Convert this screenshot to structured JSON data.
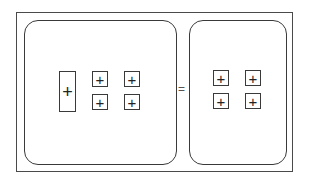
{
  "diagram": {
    "type": "algebra-tiles-equation",
    "left_side": {
      "tiles": [
        {
          "kind": "x",
          "sign": "+"
        },
        {
          "kind": "unit",
          "sign": "+"
        },
        {
          "kind": "unit",
          "sign": "+"
        },
        {
          "kind": "unit",
          "sign": "+"
        },
        {
          "kind": "unit",
          "sign": "+"
        }
      ]
    },
    "operator": "=",
    "right_side": {
      "tiles": [
        {
          "kind": "unit",
          "sign": "+"
        },
        {
          "kind": "unit",
          "sign": "+"
        },
        {
          "kind": "unit",
          "sign": "+"
        },
        {
          "kind": "unit",
          "sign": "+"
        }
      ]
    },
    "colors": {
      "stroke": "#3a3a3a",
      "background": "#ffffff"
    }
  }
}
